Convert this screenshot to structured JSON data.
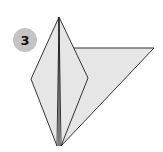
{
  "step": {
    "number": "3"
  },
  "diagram": {
    "colors": {
      "paper_fill": "#e6e6e6",
      "stroke": "#333333",
      "badge_fill": "#c4c4c4",
      "badge_text": "#111111"
    },
    "shapes": {
      "flap_triangle": "73,48 154,48 61,146",
      "kite_left_half": "59,17 31,79 57,146",
      "kite_right_half": "59,17 88,78 61,146",
      "center_crease": "59,17 59,146"
    }
  }
}
